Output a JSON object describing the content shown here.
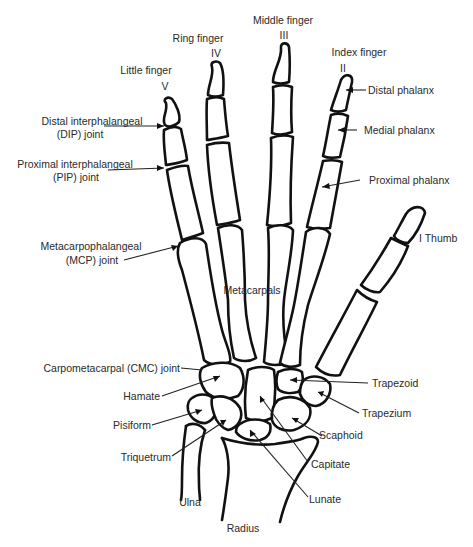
{
  "diagram": {
    "colors": {
      "line": "#111111",
      "text": "#2a2a2a",
      "background": "#ffffff"
    },
    "fingers": [
      {
        "name": "Little finger",
        "numeral": "V"
      },
      {
        "name": "Ring finger",
        "numeral": "IV"
      },
      {
        "name": "Middle finger",
        "numeral": "III"
      },
      {
        "name": "Index finger",
        "numeral": "II"
      },
      {
        "name": "Thumb",
        "numeral": "I",
        "label": "I Thumb"
      }
    ],
    "labels": {
      "dip_joint": [
        "Distal interphalangeal",
        "(DIP) joint"
      ],
      "pip_joint": [
        "Proximal interphalangeal",
        "(PIP) joint"
      ],
      "mcp_joint": [
        "Metacarpophalangeal",
        "(MCP) joint"
      ],
      "cmc_joint": "Carpometacarpal (CMC) joint",
      "distal_phalanx": "Distal phalanx",
      "medial_phalanx": "Medial phalanx",
      "proximal_phalanx": "Proximal phalanx",
      "thumb": "I Thumb",
      "metacarpals": "Metacarpals",
      "hamate": "Hamate",
      "pisiform": "Pisiform",
      "triquetrum": "Triquetrum",
      "ulna": "Ulna",
      "radius": "Radius",
      "trapezoid": "Trapezoid",
      "trapezium": "Trapezium",
      "scaphoid": "Scaphoid",
      "capitate": "Capitate",
      "lunate": "Lunate"
    }
  }
}
